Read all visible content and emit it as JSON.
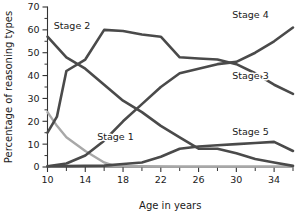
{
  "chart_data": {
    "type": "line",
    "title": "",
    "xlabel": "Age in years",
    "ylabel": "Percentage of reasoning types",
    "xlim": [
      10,
      36
    ],
    "ylim": [
      0,
      70
    ],
    "grid": false,
    "legend_position": "inline-labels",
    "x_ticks": [
      10,
      14,
      18,
      22,
      26,
      30,
      34
    ],
    "x_tick_labels": [
      "10",
      "14",
      "18",
      "22",
      "26",
      "30",
      "34"
    ],
    "x_minor_ticks": [
      12,
      16,
      20,
      24,
      28,
      32,
      36
    ],
    "y_ticks": [
      0,
      10,
      20,
      30,
      40,
      50,
      60,
      70
    ],
    "y_tick_labels": [
      "0",
      "10",
      "20",
      "30",
      "40",
      "50",
      "60",
      "70"
    ],
    "y_minor_ticks": [
      5,
      15,
      25,
      35,
      45,
      55,
      65
    ],
    "series": [
      {
        "name": "Stage 1",
        "color": "#a8a8a8",
        "label_x": 17.2,
        "label_y": 13.5,
        "x": [
          10,
          11,
          12,
          14,
          16,
          17,
          18,
          20,
          24,
          28,
          32,
          36
        ],
        "values": [
          24,
          18,
          13,
          7,
          2,
          0.6,
          0.4,
          0.3,
          0.2,
          0.2,
          0.2,
          0.2
        ]
      },
      {
        "name": "Stage 2",
        "color": "#4a4a4a",
        "label_x": 12.6,
        "label_y": 62,
        "x": [
          10,
          12,
          14,
          16,
          18,
          20,
          22,
          24,
          26,
          28,
          30,
          32,
          34,
          36
        ],
        "values": [
          57,
          48,
          43,
          36,
          29,
          24,
          18,
          13,
          8,
          8,
          6,
          3.5,
          2,
          0.5
        ]
      },
      {
        "name": "Stage 3",
        "color": "#4a4a4a",
        "label_x": 31.5,
        "label_y": 40,
        "x": [
          10,
          11,
          12,
          14,
          16,
          18,
          20,
          22,
          24,
          26,
          28,
          30,
          32,
          34,
          36
        ],
        "values": [
          15,
          22,
          42,
          47,
          60,
          59.5,
          58,
          57,
          48,
          47.5,
          47,
          45,
          41,
          36,
          32
        ]
      },
      {
        "name": "Stage 4",
        "color": "#4a4a4a",
        "label_x": 31.5,
        "label_y": 66.5,
        "x": [
          10,
          12,
          14,
          16,
          18,
          20,
          22,
          24,
          26,
          28,
          30,
          32,
          34,
          36
        ],
        "values": [
          0.3,
          1.5,
          5,
          11.5,
          20,
          27.5,
          35,
          41,
          43,
          45,
          46,
          50,
          55,
          61
        ]
      },
      {
        "name": "Stage 5",
        "color": "#4a4a4a",
        "label_x": 31.5,
        "label_y": 15.5,
        "x": [
          10,
          12,
          14,
          16,
          18,
          20,
          22,
          24,
          26,
          28,
          30,
          32,
          34,
          36
        ],
        "values": [
          0.3,
          0.4,
          0.5,
          0.6,
          1.3,
          2,
          4.5,
          8,
          9,
          9.5,
          10,
          10.5,
          11,
          7
        ]
      }
    ]
  }
}
